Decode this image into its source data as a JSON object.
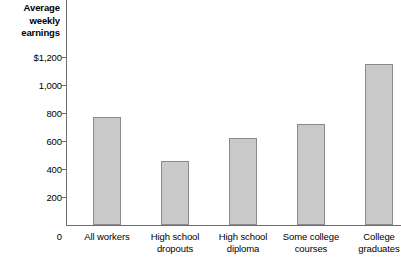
{
  "chart_data": {
    "type": "bar",
    "title": "",
    "ylabel": "Average weekly earnings",
    "ylabel_lines": [
      "Average",
      "weekly",
      "earnings"
    ],
    "xlabel": "",
    "categories": [
      "All workers",
      "High school dropouts",
      "High school diploma",
      "Some college courses",
      "College graduates"
    ],
    "category_lines": [
      [
        "All workers",
        ""
      ],
      [
        "High school",
        "dropouts"
      ],
      [
        "High school",
        "diploma"
      ],
      [
        "Some college",
        "courses"
      ],
      [
        "College",
        "graduates"
      ]
    ],
    "values": [
      770,
      455,
      620,
      725,
      1150
    ],
    "ylim": [
      0,
      1200
    ],
    "yticks": [
      0,
      200,
      400,
      600,
      800,
      1000,
      1200
    ],
    "ytick_labels": [
      "0",
      "200",
      "400",
      "600",
      "800",
      "1,000",
      "$1,200"
    ],
    "grid": false,
    "legend": null,
    "bar_color": "#c9c9c9",
    "bar_edge_color": "#8a8a8a",
    "axis_color": "#6e6e6e"
  }
}
